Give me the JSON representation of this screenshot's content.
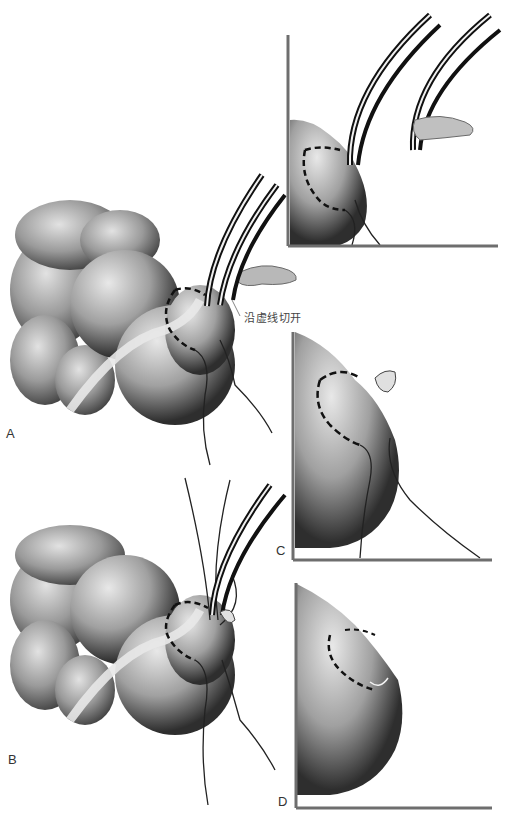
{
  "figure": {
    "panels": [
      {
        "id": "A",
        "label": "A",
        "description": "Intestinal loops with appendix base clamped by curved forceps; dashed incision line with purse-string suture"
      },
      {
        "id": "B",
        "label": "B",
        "description": "Purse-string suture threads pulled while forceps hold stump"
      },
      {
        "id": "C",
        "label": "C",
        "description": "Close-up: stump inverted, dashed purse-string line with suture ends"
      },
      {
        "id": "D",
        "label": "D",
        "description": "Close-up: purse-string tied, stump buried"
      },
      {
        "id": "top-inset",
        "label": "",
        "description": "Close-up: forceps on stump, second forceps removing appendix"
      }
    ],
    "annotation": "沿虚线切开",
    "colors": {
      "tissue_dark": "#3a3a3a",
      "tissue_mid": "#8a8a8a",
      "tissue_light": "#d6d6d6",
      "frame": "#6e6e6e",
      "background": "#ffffff"
    }
  }
}
